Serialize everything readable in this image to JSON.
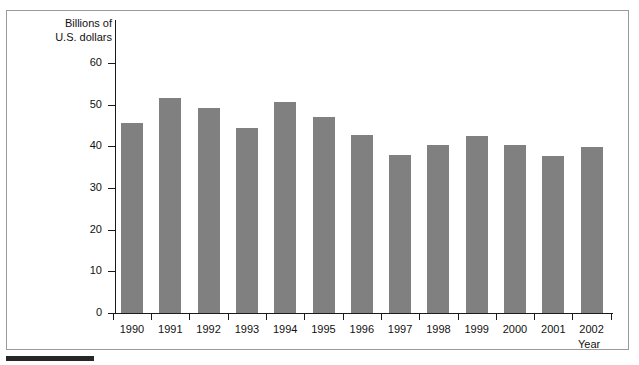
{
  "chart_data": {
    "type": "bar",
    "title": "",
    "subtitle": "",
    "xlabel": "Year",
    "ylabel": "Billions of\nU.S. dollars",
    "categories": [
      "1990",
      "1991",
      "1992",
      "1993",
      "1994",
      "1995",
      "1996",
      "1997",
      "1998",
      "1999",
      "2000",
      "2001",
      "2002"
    ],
    "values": [
      45.5,
      51.6,
      49.2,
      44.3,
      50.6,
      47.0,
      42.8,
      37.9,
      40.4,
      42.5,
      40.3,
      37.8,
      39.8
    ],
    "ylim": [
      0,
      65
    ],
    "yticks": [
      0,
      10,
      20,
      30,
      40,
      50,
      60
    ],
    "ytick_labels": [
      "0",
      "10",
      "20",
      "30",
      "40",
      "50",
      "60"
    ],
    "grid": false,
    "legend": null,
    "series_color": "#808080",
    "axis_color": "#1a1a1a",
    "frame_color": "#9a9a9a"
  }
}
